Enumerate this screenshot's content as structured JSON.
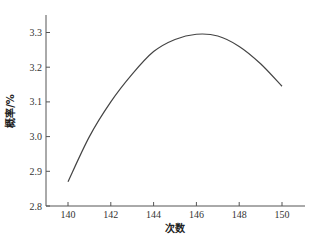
{
  "chart_data": {
    "type": "line",
    "title": "",
    "xlabel": "次数",
    "ylabel": "概率/%",
    "xlim": [
      139.1,
      151.1
    ],
    "ylim": [
      2.8,
      3.35
    ],
    "x_ticks": [
      140,
      142,
      144,
      146,
      148,
      150
    ],
    "y_ticks": [
      2.8,
      2.9,
      3.0,
      3.1,
      3.2,
      3.3
    ],
    "x_tick_labels": [
      "140",
      "142",
      "144",
      "146",
      "148",
      "150"
    ],
    "y_tick_labels": [
      "2.8",
      "2.9",
      "3.0",
      "3.1",
      "3.2",
      "3.3"
    ],
    "grid": false,
    "legend": null,
    "series": [
      {
        "name": "概率",
        "color": "#444444",
        "x": [
          140,
          141,
          142,
          143,
          144,
          145,
          146,
          147,
          148,
          149,
          150
        ],
        "y": [
          2.87,
          3.0,
          3.1,
          3.18,
          3.245,
          3.28,
          3.295,
          3.29,
          3.26,
          3.21,
          3.145
        ]
      }
    ]
  }
}
